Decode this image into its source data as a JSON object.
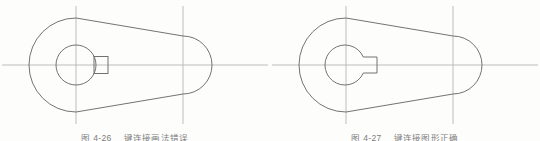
{
  "page": {
    "background_color": "#fdfdfc",
    "width": 540,
    "height": 141
  },
  "style": {
    "outline_color": "#6b6b6b",
    "centerline_color": "#b5b5b5",
    "caption_color": "#4a4a4a"
  },
  "figures": [
    {
      "id": "figure-left",
      "role": "incorrect-drawing",
      "description": "Plan view of a crank/eccentric arm: large circular boss on the left joined by straight tapering flanks to a smaller rounded end on the right. A bore circle sits in the large boss with a detached rectangular key block drawn outside the bore.",
      "caption_number": "图 4-26",
      "caption_text": "键连接画法错误",
      "geometry": {
        "big_end_center": [
          76,
          65
        ],
        "big_end_radius": 47,
        "small_end_center": [
          183,
          65
        ],
        "small_end_radius": 29,
        "bore_center": [
          76,
          65
        ],
        "bore_radius": 20,
        "key_rect": {
          "x": 94,
          "y": 56,
          "w": 14,
          "h": 17
        }
      },
      "centerlines": {
        "horizontal": {
          "y": 65,
          "x1": 2,
          "x2": 268
        },
        "verticals": [
          {
            "x": 76,
            "y1": 6,
            "y2": 124
          },
          {
            "x": 183,
            "y1": 6,
            "y2": 124
          }
        ]
      }
    },
    {
      "id": "figure-right",
      "role": "correct-drawing",
      "description": "Same crank/eccentric arm plan view, but the keyway is drawn correctly as a notch opening out of the bore circle, merged with it.",
      "caption_number": "图 4-27",
      "caption_text": "键连接图形正too上确",
      "geometry": {
        "big_end_center": [
          76,
          65
        ],
        "big_end_radius": 47,
        "small_end_center": [
          183,
          65
        ],
        "small_end_radius": 29,
        "bore_center": [
          76,
          65
        ],
        "bore_radius": 20,
        "keyway": {
          "x": 93,
          "y": 57,
          "w": 14,
          "h": 15
        }
      },
      "centerlines": {
        "horizontal": {
          "y": 65,
          "x1": 2,
          "x2": 268
        },
        "verticals": [
          {
            "x": 76,
            "y1": 6,
            "y2": 124
          },
          {
            "x": 183,
            "y1": 6,
            "y2": 124
          }
        ]
      }
    }
  ],
  "captions": {
    "left": {
      "number": "图 4-26",
      "text": "键连接画法错误"
    },
    "right": {
      "number": "图 4-27",
      "text": "键连接图形正确"
    }
  }
}
